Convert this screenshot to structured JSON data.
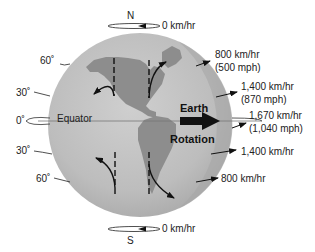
{
  "diagram": {
    "poles": {
      "north": {
        "label": "N",
        "speed": "0 km/hr"
      },
      "south": {
        "label": "S",
        "speed": "0 km/hr"
      }
    },
    "latitudes": {
      "n60": "60˚",
      "n30": "30˚",
      "eq": "0˚",
      "s30": "30˚",
      "s60": "60˚"
    },
    "equator_label": "Equator",
    "rotation_label_top": "Earth",
    "rotation_label_bottom": "Rotation",
    "speeds": {
      "n60": {
        "kmh": "800 km/hr",
        "mph": "(500 mph)"
      },
      "n30": {
        "kmh": "1,400 km/hr",
        "mph": "(870 mph)"
      },
      "eq": {
        "kmh": "1,670 km/hr",
        "mph": "(1,040 mph)"
      },
      "s30": {
        "kmh": "1,400 km/hr"
      },
      "s60": {
        "kmh": "800 km/hr"
      }
    },
    "colors": {
      "globe": "#b9b9b9",
      "globe_edge": "#a3a3a3",
      "land": "#8c8c8c",
      "arrow": "#111111"
    }
  }
}
